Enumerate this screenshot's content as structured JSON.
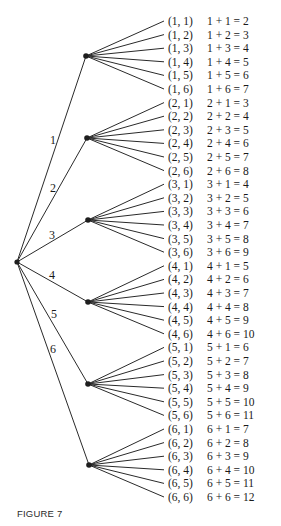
{
  "figure": {
    "caption": "FIGURE 7",
    "root": {
      "x": 17,
      "y": 262
    },
    "first_nodes": [
      {
        "label": "1",
        "x": 86,
        "y": 56,
        "label_x": 50,
        "label_y": 144
      },
      {
        "label": "2",
        "x": 87,
        "y": 138,
        "label_x": 50,
        "label_y": 192
      },
      {
        "label": "3",
        "x": 88,
        "y": 220,
        "label_x": 49,
        "label_y": 239
      },
      {
        "label": "4",
        "x": 88,
        "y": 302,
        "label_x": 49,
        "label_y": 279
      },
      {
        "label": "5",
        "x": 88,
        "y": 384,
        "label_x": 51,
        "label_y": 318
      },
      {
        "label": "6",
        "x": 89,
        "y": 465,
        "label_x": 50,
        "label_y": 353
      }
    ],
    "outcomes": [
      {
        "pair": "(1, 1)",
        "sum": "1 + 1 = 2"
      },
      {
        "pair": "(1, 2)",
        "sum": "1 + 2 = 3"
      },
      {
        "pair": "(1, 3)",
        "sum": "1 + 3 = 4"
      },
      {
        "pair": "(1, 4)",
        "sum": "1 + 4 = 5"
      },
      {
        "pair": "(1, 5)",
        "sum": "1 + 5 = 6"
      },
      {
        "pair": "(1, 6)",
        "sum": "1 + 6 = 7"
      },
      {
        "pair": "(2, 1)",
        "sum": "2 + 1 = 3"
      },
      {
        "pair": "(2, 2)",
        "sum": "2 + 2 = 4"
      },
      {
        "pair": "(2, 3)",
        "sum": "2 + 3 = 5"
      },
      {
        "pair": "(2, 4)",
        "sum": "2 + 4 = 6"
      },
      {
        "pair": "(2, 5)",
        "sum": "2 + 5 = 7"
      },
      {
        "pair": "(2, 6)",
        "sum": "2 + 6 = 8"
      },
      {
        "pair": "(3, 1)",
        "sum": "3 + 1 = 4"
      },
      {
        "pair": "(3, 2)",
        "sum": "3 + 2 = 5"
      },
      {
        "pair": "(3, 3)",
        "sum": "3 + 3 = 6"
      },
      {
        "pair": "(3, 4)",
        "sum": "3 + 4 = 7"
      },
      {
        "pair": "(3, 5)",
        "sum": "3 + 5 = 8"
      },
      {
        "pair": "(3, 6)",
        "sum": "3 + 6 = 9"
      },
      {
        "pair": "(4, 1)",
        "sum": "4 + 1 = 5"
      },
      {
        "pair": "(4, 2)",
        "sum": "4 + 2 = 6"
      },
      {
        "pair": "(4, 3)",
        "sum": "4 + 3 = 7"
      },
      {
        "pair": "(4, 4)",
        "sum": "4 + 4 = 8"
      },
      {
        "pair": "(4, 5)",
        "sum": "4 + 5 = 9"
      },
      {
        "pair": "(4, 6)",
        "sum": "4 + 6 = 10"
      },
      {
        "pair": "(5, 1)",
        "sum": "5 + 1 = 6"
      },
      {
        "pair": "(5, 2)",
        "sum": "5 + 2 = 7"
      },
      {
        "pair": "(5, 3)",
        "sum": "5 + 3 = 8"
      },
      {
        "pair": "(5, 4)",
        "sum": "5 + 4 = 9"
      },
      {
        "pair": "(5, 5)",
        "sum": "5 + 5 = 10"
      },
      {
        "pair": "(5, 6)",
        "sum": "5 + 6 = 11"
      },
      {
        "pair": "(6, 1)",
        "sum": "6 + 1 = 7"
      },
      {
        "pair": "(6, 2)",
        "sum": "6 + 2 = 8"
      },
      {
        "pair": "(6, 3)",
        "sum": "6 + 3 = 9"
      },
      {
        "pair": "(6, 4)",
        "sum": "6 + 4 = 10"
      },
      {
        "pair": "(6, 5)",
        "sum": "6 + 5 = 11"
      },
      {
        "pair": "(6, 6)",
        "sum": "6 + 6 = 12"
      }
    ],
    "layout": {
      "leaf_end_x": 164,
      "pair_x": 168,
      "sum_x": 207,
      "first_row_y": 21,
      "row_step": 13.6
    }
  }
}
